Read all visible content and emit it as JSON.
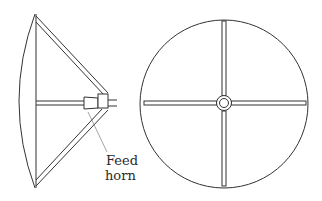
{
  "diagram": {
    "views": [
      {
        "name": "side-view",
        "label": ""
      },
      {
        "name": "front-view",
        "label": ""
      }
    ],
    "labels": {
      "feed_horn_line1": "Feed",
      "feed_horn_line2": "horn"
    },
    "colors": {
      "line": "#333333",
      "background": "#ffffff"
    }
  }
}
